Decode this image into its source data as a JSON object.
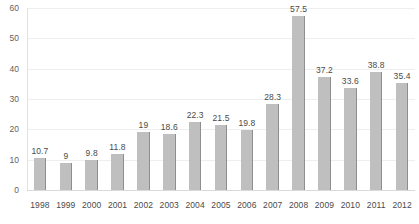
{
  "chart_data": {
    "type": "bar",
    "title": "",
    "subtitle": "",
    "xlabel": "",
    "ylabel": "",
    "ylim": [
      0,
      60
    ],
    "yticks": [
      0,
      10,
      20,
      30,
      40,
      50,
      60
    ],
    "grid": true,
    "legend": false,
    "legend_position": "none",
    "categories": [
      "1998",
      "1999",
      "2000",
      "2001",
      "2002",
      "2003",
      "2004",
      "2005",
      "2006",
      "2007",
      "2008",
      "2009",
      "2010",
      "2011",
      "2012"
    ],
    "values": [
      10.7,
      9,
      9.8,
      11.8,
      19,
      18.6,
      22.3,
      21.5,
      19.8,
      28.3,
      57.5,
      37.2,
      33.6,
      38.8,
      35.4
    ],
    "data_labels": [
      "10.7",
      "9",
      "9.8",
      "11.8",
      "19",
      "18.6",
      "22.3",
      "21.5",
      "19.8",
      "28.3",
      "57.5",
      "37.2",
      "33.6",
      "38.8",
      "35.4"
    ],
    "series": [
      {
        "name": "",
        "values": [
          10.7,
          9,
          9.8,
          11.8,
          19,
          18.6,
          22.3,
          21.5,
          19.8,
          28.3,
          57.5,
          37.2,
          33.6,
          38.8,
          35.4
        ]
      }
    ],
    "colors": {
      "bar_fill": "#bfbfbf",
      "bar_edge": "#8e8e8e",
      "gridline": "#eeeeee",
      "axis_line": "#d9d9d9",
      "tick_text": "#5f5f5f",
      "label_text": "#4a4a4a",
      "background": "#ffffff"
    }
  }
}
